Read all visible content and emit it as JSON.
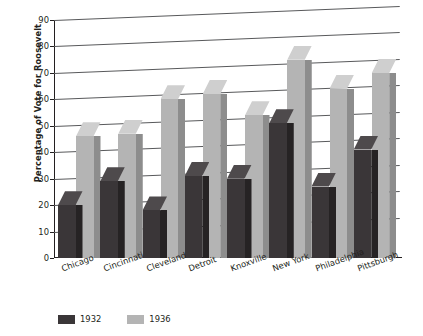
{
  "chart_data": {
    "type": "bar",
    "title": "",
    "xlabel": "",
    "ylabel": "Percentage of Vote for Roosevelt",
    "ylim": [
      0,
      90
    ],
    "yticks": [
      0,
      10,
      20,
      30,
      40,
      50,
      60,
      70,
      80,
      90
    ],
    "grid": true,
    "legend_position": "bottom-left",
    "categories": [
      "Chicago",
      "Cincinnati",
      "Cleveland",
      "Detroit",
      "Knoxville",
      "New York",
      "Philadelphia",
      "Pittsburgh"
    ],
    "series": [
      {
        "name": "1932",
        "color": "#3a3638",
        "values": [
          20,
          29,
          18,
          31,
          30,
          51,
          27,
          41
        ]
      },
      {
        "name": "1936",
        "color": "#b4b4b4",
        "values": [
          46,
          47,
          60,
          62,
          54,
          75,
          64,
          70
        ]
      }
    ]
  },
  "legend": {
    "items": [
      {
        "label": "1932",
        "color": "#3a3638"
      },
      {
        "label": "1936",
        "color": "#b4b4b4"
      }
    ]
  },
  "colors": {
    "series_1932": "#3a3638",
    "series_1936": "#b4b4b4",
    "axis": "#231f20",
    "gridline": "#58595b",
    "background": "#ffffff"
  }
}
